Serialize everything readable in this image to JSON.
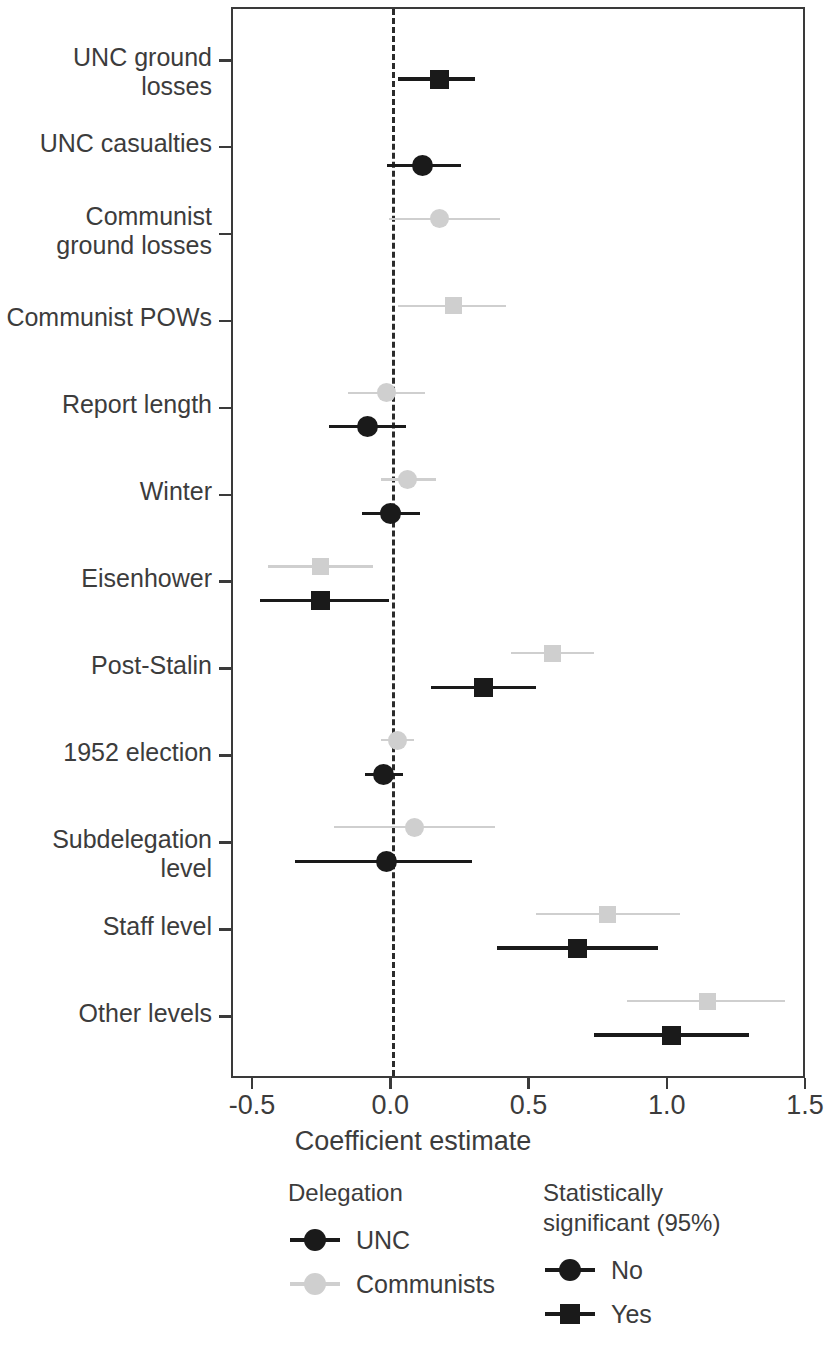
{
  "chart_data": {
    "type": "scatter",
    "subtype": "coefficient-plot",
    "title": "",
    "xlabel": "Coefficient estimate",
    "ylabel": "",
    "xlim": [
      -0.5,
      1.5
    ],
    "xticks": [
      -0.5,
      0.0,
      0.5,
      1.0,
      1.5
    ],
    "xticklabels": [
      "-0.5",
      "0.0",
      "0.5",
      "1.0",
      "1.5"
    ],
    "grid": false,
    "reference_line": 0.0,
    "reference_line_style": "dashed",
    "categories": [
      "UNC ground losses",
      "UNC casualties",
      "Communist\nground losses",
      "Communist POWs",
      "Report length",
      "Winter",
      "Eisenhower",
      "Post-Stalin",
      "1952 election",
      "Subdelegation level",
      "Staff level",
      "Other levels"
    ],
    "series": [
      {
        "name": "UNC",
        "color": "#1a1a1a",
        "points": [
          {
            "category": "UNC ground losses",
            "estimate": 0.17,
            "ci_low": 0.02,
            "ci_high": 0.3,
            "significant": "Yes"
          },
          {
            "category": "UNC casualties",
            "estimate": 0.11,
            "ci_low": -0.02,
            "ci_high": 0.25,
            "significant": "No"
          },
          {
            "category": "Communist\nground losses",
            "estimate": null,
            "ci_low": null,
            "ci_high": null,
            "significant": null
          },
          {
            "category": "Communist POWs",
            "estimate": null,
            "ci_low": null,
            "ci_high": null,
            "significant": null
          },
          {
            "category": "Report length",
            "estimate": -0.09,
            "ci_low": -0.23,
            "ci_high": 0.05,
            "significant": "No"
          },
          {
            "category": "Winter",
            "estimate": -0.005,
            "ci_low": -0.11,
            "ci_high": 0.1,
            "significant": "No"
          },
          {
            "category": "Eisenhower",
            "estimate": -0.26,
            "ci_low": -0.48,
            "ci_high": -0.01,
            "significant": "Yes"
          },
          {
            "category": "Post-Stalin",
            "estimate": 0.33,
            "ci_low": 0.14,
            "ci_high": 0.52,
            "significant": "Yes"
          },
          {
            "category": "1952 election",
            "estimate": -0.03,
            "ci_low": -0.1,
            "ci_high": 0.04,
            "significant": "No"
          },
          {
            "category": "Subdelegation level",
            "estimate": -0.02,
            "ci_low": -0.35,
            "ci_high": 0.29,
            "significant": "No"
          },
          {
            "category": "Staff level",
            "estimate": 0.67,
            "ci_low": 0.38,
            "ci_high": 0.96,
            "significant": "Yes"
          },
          {
            "category": "Other levels",
            "estimate": 1.01,
            "ci_low": 0.73,
            "ci_high": 1.29,
            "significant": "Yes"
          }
        ]
      },
      {
        "name": "Communists",
        "color": "#cfcfcf",
        "points": [
          {
            "category": "UNC ground losses",
            "estimate": null,
            "ci_low": null,
            "ci_high": null,
            "significant": null
          },
          {
            "category": "UNC casualties",
            "estimate": null,
            "ci_low": null,
            "ci_high": null,
            "significant": null
          },
          {
            "category": "Communist\nground losses",
            "estimate": 0.17,
            "ci_low": -0.01,
            "ci_high": 0.39,
            "significant": "No"
          },
          {
            "category": "Communist POWs",
            "estimate": 0.22,
            "ci_low": 0.02,
            "ci_high": 0.41,
            "significant": "Yes"
          },
          {
            "category": "Report length",
            "estimate": -0.02,
            "ci_low": -0.16,
            "ci_high": 0.12,
            "significant": "No"
          },
          {
            "category": "Winter",
            "estimate": 0.055,
            "ci_low": -0.04,
            "ci_high": 0.16,
            "significant": "No"
          },
          {
            "category": "Eisenhower",
            "estimate": -0.26,
            "ci_low": -0.45,
            "ci_high": -0.07,
            "significant": "Yes"
          },
          {
            "category": "Post-Stalin",
            "estimate": 0.58,
            "ci_low": 0.43,
            "ci_high": 0.73,
            "significant": "Yes"
          },
          {
            "category": "1952 election",
            "estimate": 0.02,
            "ci_low": -0.04,
            "ci_high": 0.08,
            "significant": "No"
          },
          {
            "category": "Subdelegation level",
            "estimate": 0.08,
            "ci_low": -0.21,
            "ci_high": 0.37,
            "significant": "No"
          },
          {
            "category": "Staff level",
            "estimate": 0.78,
            "ci_low": 0.52,
            "ci_high": 1.04,
            "significant": "Yes"
          },
          {
            "category": "Other levels",
            "estimate": 1.14,
            "ci_low": 0.85,
            "ci_high": 1.42,
            "significant": "Yes"
          }
        ]
      }
    ],
    "legends": [
      {
        "title": "Delegation",
        "entries": [
          {
            "label": "UNC",
            "color": "#1a1a1a",
            "shape": "circle"
          },
          {
            "label": "Communists",
            "color": "#cfcfcf",
            "shape": "circle"
          }
        ]
      },
      {
        "title": "Statistically\nsignificant (95%)",
        "entries": [
          {
            "label": "No",
            "color": "#1a1a1a",
            "shape": "circle"
          },
          {
            "label": "Yes",
            "color": "#1a1a1a",
            "shape": "square"
          }
        ]
      }
    ]
  }
}
